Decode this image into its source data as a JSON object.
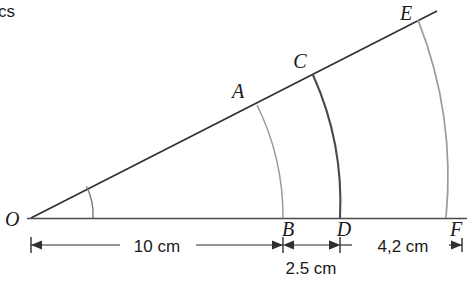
{
  "figure": {
    "corner_text": "cs",
    "type": "geometry-diagram",
    "colors": {
      "ray_line": "#2e2e33",
      "baseline": "#4a4a50",
      "arc_light": "#9a9a9a",
      "arc_dark": "#4a4a50",
      "angle_arc": "#6e6e74",
      "dimension_line": "#2e2e33",
      "label_text": "#1a1a1a"
    },
    "vertex": {
      "label": "O",
      "x": 31,
      "y": 218
    },
    "points": [
      {
        "label": "A",
        "x": 257,
        "y": 105,
        "label_x": 238,
        "label_y": 98,
        "on": "upper-ray"
      },
      {
        "label": "C",
        "x": 313,
        "y": 75,
        "label_x": 296,
        "label_y": 68,
        "on": "upper-ray"
      },
      {
        "label": "E",
        "x": 418,
        "y": 20,
        "label_x": 402,
        "label_y": 18,
        "on": "upper-ray"
      },
      {
        "label": "B",
        "x": 283,
        "y": 218,
        "label_x": 277,
        "label_y": 236,
        "on": "baseline"
      },
      {
        "label": "D",
        "x": 340,
        "y": 218,
        "label_x": 333,
        "label_y": 236,
        "on": "baseline"
      },
      {
        "label": "F",
        "x": 459,
        "y": 218,
        "label_x": 449,
        "label_y": 236,
        "on": "baseline"
      }
    ],
    "arcs": [
      {
        "name": "arc-A-B",
        "from": "A",
        "to": "B",
        "radius": 253,
        "shade": "light"
      },
      {
        "name": "arc-C-D",
        "from": "C",
        "to": "D",
        "radius": 310,
        "shade": "dark"
      },
      {
        "name": "arc-E-F",
        "from": "E",
        "to": "F",
        "radius": 428,
        "shade": "light"
      }
    ],
    "angle_marker": {
      "radius": 62,
      "label": ""
    },
    "dimensions": [
      {
        "name": "dim-10cm",
        "label": "10 cm",
        "from_x": 31,
        "to_x": 283,
        "y": 245,
        "label_x": 157,
        "label_y": 252
      },
      {
        "name": "dim-2-5cm",
        "label": "2.5 cm",
        "from_x": 283,
        "to_x": 340,
        "y": 245,
        "label_x": 311,
        "label_y": 274
      },
      {
        "name": "dim-4-2cm",
        "label": "4,2 cm",
        "from_x": 340,
        "to_x": 460,
        "y": 245,
        "label_x": 400,
        "label_y": 252
      }
    ]
  }
}
